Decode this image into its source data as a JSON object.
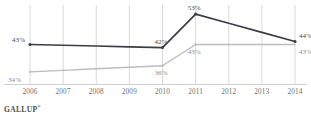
{
  "source": {
    "name": "GALLUP",
    "mark": "®"
  },
  "chart_data": {
    "type": "line",
    "title": "",
    "subtitle": "",
    "xlabel": "",
    "ylabel": "",
    "grid": "vertical",
    "legend_position": "none",
    "x": [
      "2006",
      "2007",
      "2008",
      "2009",
      "2010",
      "2011",
      "2012",
      "2013",
      "2014"
    ],
    "xlim": [
      2006,
      2014
    ],
    "ylim": [
      30,
      56
    ],
    "tick_labels": [
      "2006",
      "2007",
      "2008",
      "2009",
      "2010",
      "2011",
      "2012",
      "2013",
      "2014"
    ],
    "series": [
      {
        "name": "dark-series",
        "color": "#3c3c46",
        "points": [
          {
            "x": "2006",
            "y": 43,
            "label": "43%",
            "labeled": true
          },
          {
            "x": "2007",
            "y": 42.75,
            "label": "",
            "labeled": false
          },
          {
            "x": "2008",
            "y": 42.5,
            "label": "",
            "labeled": false
          },
          {
            "x": "2009",
            "y": 42.25,
            "label": "",
            "labeled": false
          },
          {
            "x": "2010",
            "y": 42,
            "label": "42%",
            "labeled": true
          },
          {
            "x": "2011",
            "y": 53,
            "label": "53%",
            "labeled": true
          },
          {
            "x": "2012",
            "y": 50,
            "label": "",
            "labeled": false
          },
          {
            "x": "2013",
            "y": 47,
            "label": "",
            "labeled": false
          },
          {
            "x": "2014",
            "y": 44,
            "label": "44%",
            "labeled": true
          }
        ]
      },
      {
        "name": "light-series",
        "color": "#bcbcbc",
        "points": [
          {
            "x": "2006",
            "y": 34,
            "label": "34%",
            "labeled": true
          },
          {
            "x": "2007",
            "y": 34.5,
            "label": "",
            "labeled": false
          },
          {
            "x": "2008",
            "y": 35,
            "label": "",
            "labeled": false
          },
          {
            "x": "2009",
            "y": 35.5,
            "label": "",
            "labeled": false
          },
          {
            "x": "2010",
            "y": 36,
            "label": "36%",
            "labeled": true
          },
          {
            "x": "2011",
            "y": 43,
            "label": "43%",
            "labeled": true
          },
          {
            "x": "2012",
            "y": 43,
            "label": "",
            "labeled": false
          },
          {
            "x": "2013",
            "y": 43,
            "label": "",
            "labeled": false
          },
          {
            "x": "2014",
            "y": 43,
            "label": "43%",
            "labeled": false
          }
        ]
      }
    ],
    "value_labels": [
      {
        "text": "43%",
        "series": "dark-series",
        "x": "2006",
        "anchor": "above-left"
      },
      {
        "text": "34%",
        "series": "light-series",
        "x": "2006",
        "anchor": "below-left"
      },
      {
        "text": "42%",
        "series": "dark-series",
        "x": "2010",
        "anchor": "above"
      },
      {
        "text": "36%",
        "series": "light-series",
        "x": "2010",
        "anchor": "below"
      },
      {
        "text": "53%",
        "series": "dark-series",
        "x": "2011",
        "anchor": "above"
      },
      {
        "text": "43%",
        "series": "light-series",
        "x": "2011",
        "anchor": "below"
      },
      {
        "text": "44%",
        "series": "dark-series",
        "x": "2014",
        "anchor": "above-right"
      },
      {
        "text": "43%",
        "series": "light-series",
        "x": "2014",
        "anchor": "below-right"
      }
    ],
    "colors": {
      "dark_line": "#3c3c46",
      "light_line": "#bcbcbc",
      "gridline": "#d6d6d6",
      "baseline": "#d0d0d0",
      "tick_text": "#6f6f6f"
    }
  }
}
